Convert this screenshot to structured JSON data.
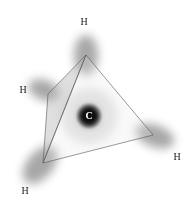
{
  "diagram": {
    "center_atom": {
      "label": "C",
      "x": 89,
      "y": 116
    },
    "vertices": {
      "top": {
        "x": 86,
        "y": 55
      },
      "left": {
        "x": 48,
        "y": 94
      },
      "bottom_left": {
        "x": 43,
        "y": 163
      },
      "right": {
        "x": 153,
        "y": 135
      }
    },
    "hydrogen_labels": [
      {
        "label": "H",
        "x": 84,
        "y": 22
      },
      {
        "label": "H",
        "x": 23,
        "y": 90
      },
      {
        "label": "H",
        "x": 177,
        "y": 157
      },
      {
        "label": "H",
        "x": 25,
        "y": 191
      }
    ],
    "colors": {
      "orbital": "#8a8a8a",
      "carbon": "#111111",
      "edge": "#555555",
      "face_back": "#b8b8b8",
      "face_front": "#e8e8e8"
    }
  }
}
